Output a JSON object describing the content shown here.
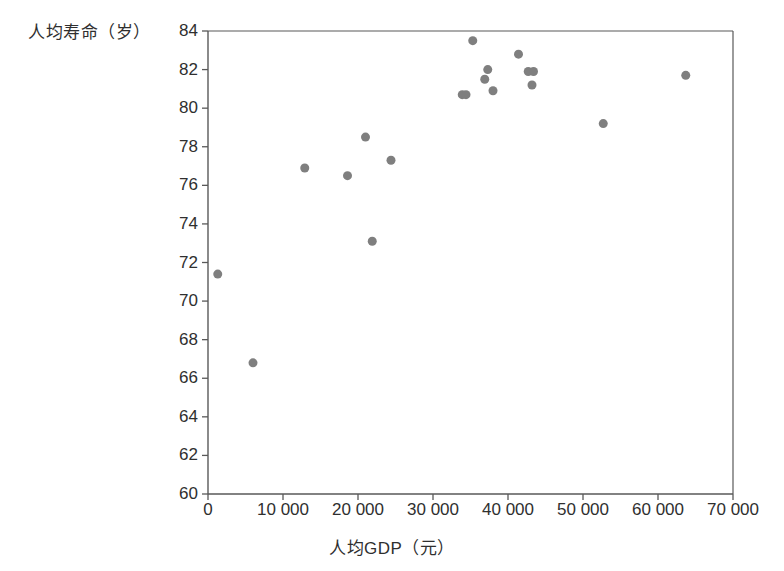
{
  "chart_data": {
    "type": "scatter",
    "title": "",
    "xlabel": "人均GDP（元）",
    "ylabel": "人均寿命（岁）",
    "xlim": [
      0,
      70000
    ],
    "ylim": [
      60,
      84
    ],
    "xticks": [
      0,
      10000,
      20000,
      30000,
      40000,
      50000,
      60000,
      70000
    ],
    "xtick_labels": [
      "0",
      "10 000",
      "20 000",
      "30 000",
      "40 000",
      "50 000",
      "60 000",
      "70 000"
    ],
    "yticks": [
      60,
      62,
      64,
      66,
      68,
      70,
      72,
      74,
      76,
      78,
      80,
      82,
      84
    ],
    "ytick_labels": [
      "60",
      "62",
      "64",
      "66",
      "68",
      "70",
      "72",
      "74",
      "76",
      "78",
      "80",
      "82",
      "84"
    ],
    "grid": false,
    "legend": null,
    "marker_color": "#7f7f7f",
    "marker_size": 9,
    "axis_color": "#595959",
    "points": [
      {
        "x": 1300,
        "y": 71.4
      },
      {
        "x": 6000,
        "y": 66.8
      },
      {
        "x": 12900,
        "y": 76.9
      },
      {
        "x": 18600,
        "y": 76.5
      },
      {
        "x": 21000,
        "y": 78.5
      },
      {
        "x": 21900,
        "y": 73.1
      },
      {
        "x": 24400,
        "y": 77.3
      },
      {
        "x": 33900,
        "y": 80.7
      },
      {
        "x": 34400,
        "y": 80.7
      },
      {
        "x": 35300,
        "y": 83.5
      },
      {
        "x": 36900,
        "y": 81.5
      },
      {
        "x": 37300,
        "y": 82.0
      },
      {
        "x": 38000,
        "y": 80.9
      },
      {
        "x": 41400,
        "y": 82.8
      },
      {
        "x": 42700,
        "y": 81.9
      },
      {
        "x": 43400,
        "y": 81.9
      },
      {
        "x": 43200,
        "y": 81.2
      },
      {
        "x": 52700,
        "y": 79.2
      },
      {
        "x": 63700,
        "y": 81.7
      }
    ]
  }
}
